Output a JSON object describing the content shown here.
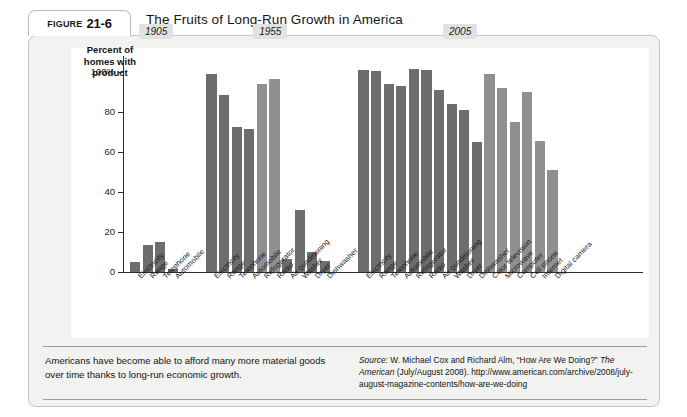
{
  "figure": {
    "tab_label": "Figure",
    "tab_number": "21-6",
    "title": "The Fruits of Long-Run Growth in America"
  },
  "axis": {
    "title_line1": "Percent of",
    "title_line2": "homes with",
    "title_line3": "product",
    "ticks": [
      "100%",
      "80",
      "60",
      "40",
      "20",
      "0"
    ]
  },
  "caption": {
    "text": "Americans have become able to afford many more material goods over time thanks to long-run economic growth."
  },
  "source": {
    "lead": "Source:",
    "part1": " W. Michael Cox and Richard Alm, “How Are We Doing?” ",
    "italic1": "The American",
    "part2": " (July/August 2008). http://www.american.com/archive/2008/july-august-magazine-contents/how-are-we-doing"
  },
  "colors": {
    "bar_dark": "#6d6d6d",
    "bar_light": "#909090",
    "panel": "#ffffff",
    "figure_bg": "#f2f2f0",
    "axis": "#2e2e2e",
    "badge_bg": "#e2e2e0"
  },
  "chart_data": {
    "type": "bar",
    "title": "The Fruits of Long-Run Growth in America",
    "xlabel": "",
    "ylabel": "Percent of homes with product",
    "ylim": [
      0,
      100
    ],
    "yticks": [
      0,
      20,
      40,
      60,
      80,
      100
    ],
    "grid": false,
    "legend": "none",
    "groups": [
      {
        "year": "1905",
        "categories": [
          "Electricity",
          "Range",
          "Telephone",
          "Automobile"
        ],
        "values": [
          5,
          13.5,
          15,
          1.5
        ],
        "shades": [
          "dark",
          "dark",
          "dark",
          "dark"
        ]
      },
      {
        "year": "1955",
        "categories": [
          "Electricity",
          "Range",
          "Telephone",
          "Automobile",
          "Refrigerator",
          "Radio",
          "Air conditioning",
          "Washer",
          "Dryer",
          "Dishwasher"
        ],
        "values": [
          99,
          88.5,
          72.5,
          71.5,
          94,
          96.5,
          6.5,
          31,
          10,
          5.5
        ],
        "shades": [
          "dark",
          "dark",
          "dark",
          "dark",
          "light",
          "light",
          "dark",
          "dark",
          "dark",
          "dark"
        ]
      },
      {
        "year": "2005",
        "categories": [
          "Electricity",
          "Range",
          "Telephone",
          "Automobile",
          "Refrigerator",
          "Radio",
          "Air conditioning",
          "Washer",
          "Dryer",
          "Dishwasher",
          "Color television",
          "Microwave",
          "Computer",
          "Cell phone",
          "Internet",
          "Digital camera"
        ],
        "values": [
          101,
          100.5,
          94,
          93,
          101.5,
          101,
          91,
          84,
          81,
          65,
          99,
          92,
          75,
          90,
          65.5,
          51
        ],
        "shades": [
          "dark",
          "dark",
          "dark",
          "dark",
          "dark",
          "dark",
          "dark",
          "dark",
          "dark",
          "dark",
          "light",
          "light",
          "light",
          "light",
          "light",
          "light"
        ]
      }
    ]
  }
}
